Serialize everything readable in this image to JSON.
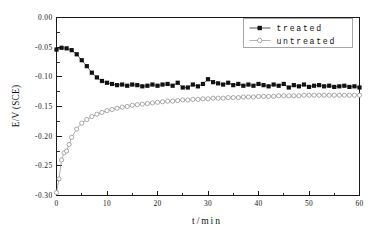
{
  "chart_data": {
    "type": "line",
    "title": "",
    "xlabel": "t/min",
    "ylabel": "E/V (SCE)",
    "xlim": [
      0,
      60
    ],
    "ylim": [
      -0.3,
      0.0
    ],
    "xticks": [
      0,
      10,
      20,
      30,
      40,
      50,
      60
    ],
    "xtick_labels": [
      "0",
      "10",
      "20",
      "30",
      "40",
      "50",
      "60"
    ],
    "yticks": [
      0.0,
      -0.05,
      -0.1,
      -0.15,
      -0.2,
      -0.25,
      -0.3
    ],
    "ytick_labels": [
      "0.00",
      "-0.05",
      "-0.10",
      "-0.15",
      "-0.20",
      "-0.25",
      "-0.30"
    ],
    "x_minor_per_major": 2,
    "y_minor_per_major": 2,
    "grid": false,
    "legend_position": "top-right",
    "legend": [
      "treated",
      "untreated"
    ],
    "series": [
      {
        "name": "treated",
        "marker": "filled-square",
        "color": "#111111",
        "x": [
          0,
          1,
          2,
          3,
          4,
          5,
          6,
          7,
          8,
          9,
          10,
          11,
          12,
          13,
          14,
          15,
          16,
          17,
          18,
          19,
          20,
          21,
          22,
          23,
          24,
          25,
          26,
          27,
          28,
          29,
          30,
          31,
          32,
          33,
          34,
          35,
          36,
          37,
          38,
          39,
          40,
          41,
          42,
          43,
          44,
          45,
          46,
          47,
          48,
          49,
          50,
          51,
          52,
          53,
          54,
          55,
          56,
          57,
          58,
          59,
          60
        ],
        "y": [
          -0.054,
          -0.051,
          -0.052,
          -0.055,
          -0.062,
          -0.072,
          -0.082,
          -0.093,
          -0.101,
          -0.107,
          -0.11,
          -0.112,
          -0.114,
          -0.113,
          -0.115,
          -0.113,
          -0.114,
          -0.116,
          -0.115,
          -0.113,
          -0.115,
          -0.113,
          -0.112,
          -0.115,
          -0.11,
          -0.118,
          -0.118,
          -0.113,
          -0.116,
          -0.112,
          -0.104,
          -0.109,
          -0.111,
          -0.113,
          -0.11,
          -0.114,
          -0.112,
          -0.115,
          -0.113,
          -0.115,
          -0.112,
          -0.114,
          -0.116,
          -0.113,
          -0.115,
          -0.112,
          -0.118,
          -0.114,
          -0.116,
          -0.113,
          -0.117,
          -0.115,
          -0.114,
          -0.116,
          -0.115,
          -0.117,
          -0.116,
          -0.115,
          -0.117,
          -0.116,
          -0.118
        ]
      },
      {
        "name": "untreated",
        "marker": "open-circle",
        "color": "#8c8c8c",
        "x": [
          0,
          0.5,
          1,
          1.5,
          2,
          2.5,
          3,
          4,
          5,
          6,
          7,
          8,
          9,
          10,
          11,
          12,
          13,
          14,
          15,
          16,
          17,
          18,
          19,
          20,
          21,
          22,
          23,
          24,
          25,
          26,
          27,
          28,
          29,
          30,
          31,
          32,
          33,
          34,
          35,
          36,
          37,
          38,
          39,
          40,
          41,
          42,
          43,
          44,
          45,
          46,
          47,
          48,
          49,
          50,
          51,
          52,
          53,
          54,
          55,
          56,
          57,
          58,
          59,
          60
        ],
        "y": [
          -0.295,
          -0.272,
          -0.24,
          -0.228,
          -0.225,
          -0.214,
          -0.202,
          -0.188,
          -0.178,
          -0.172,
          -0.167,
          -0.163,
          -0.16,
          -0.157,
          -0.155,
          -0.153,
          -0.151,
          -0.15,
          -0.148,
          -0.147,
          -0.146,
          -0.145,
          -0.144,
          -0.143,
          -0.142,
          -0.141,
          -0.141,
          -0.14,
          -0.139,
          -0.139,
          -0.138,
          -0.138,
          -0.137,
          -0.137,
          -0.136,
          -0.136,
          -0.136,
          -0.135,
          -0.135,
          -0.135,
          -0.134,
          -0.134,
          -0.134,
          -0.133,
          -0.133,
          -0.133,
          -0.133,
          -0.132,
          -0.132,
          -0.132,
          -0.132,
          -0.132,
          -0.131,
          -0.131,
          -0.131,
          -0.131,
          -0.131,
          -0.131,
          -0.131,
          -0.131,
          -0.131,
          -0.131,
          -0.131,
          -0.131
        ]
      }
    ]
  }
}
